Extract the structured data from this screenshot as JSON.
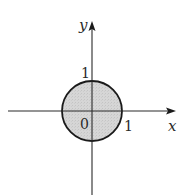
{
  "figure": {
    "type": "unit disk in the xy-plane",
    "axes": {
      "x_label": "x",
      "y_label": "y"
    },
    "tick_labels": {
      "origin": "0",
      "x_one": "1",
      "y_one": "1"
    },
    "region": {
      "shape": "circle",
      "center": [
        0,
        0
      ],
      "radius": 1,
      "fill": "#d4d4d4",
      "stroke": "#1a1a1a"
    },
    "colors": {
      "axis": "#2a2a2a",
      "background": "#ffffff"
    }
  }
}
